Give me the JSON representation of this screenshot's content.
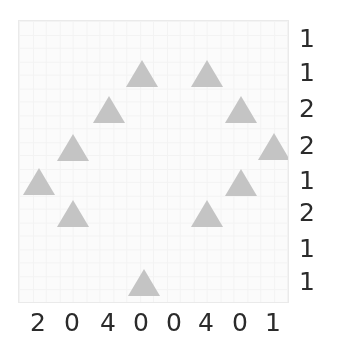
{
  "figure": {
    "width": 337,
    "height": 354,
    "background_color": "#ffffff"
  },
  "plot": {
    "background_color": "#fbfbfb",
    "border_color": "#eaeaea",
    "marker_color": "#c4c4c4",
    "tick_label_color": "#2b2b2b"
  },
  "chart_data": {
    "type": "scatter",
    "title": "",
    "xlabel": "",
    "ylabel": "",
    "marker": "triangle-up",
    "marker_color": "#c4c4c4",
    "grid": true,
    "legend": null,
    "x_tick_labels": [
      "2",
      "0",
      "4",
      "0",
      "0",
      "4",
      "0",
      "1"
    ],
    "y_tick_labels": [
      "1",
      "1",
      "2",
      "2",
      "1",
      "2",
      "1",
      "1"
    ],
    "x_tick_positions": [
      38,
      72,
      108,
      141,
      174,
      206,
      240,
      273
    ],
    "y_tick_positions": [
      38,
      72,
      108,
      145,
      180,
      212,
      248,
      281
    ],
    "points": [
      {
        "x": 141,
        "y": 72
      },
      {
        "x": 206,
        "y": 72
      },
      {
        "x": 108,
        "y": 108
      },
      {
        "x": 240,
        "y": 108
      },
      {
        "x": 72,
        "y": 146
      },
      {
        "x": 273,
        "y": 145
      },
      {
        "x": 38,
        "y": 180
      },
      {
        "x": 240,
        "y": 181
      },
      {
        "x": 72,
        "y": 212
      },
      {
        "x": 206,
        "y": 212
      },
      {
        "x": 143,
        "y": 281
      }
    ],
    "n_points": 11
  }
}
